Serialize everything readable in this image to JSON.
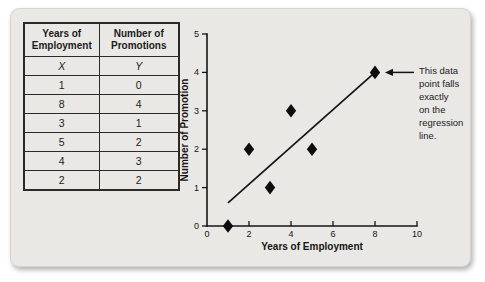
{
  "table": {
    "col1_header": "Years of\nEmployment",
    "col2_header": "Number of\nPromotions",
    "var_labels": [
      "X",
      "Y"
    ],
    "rows": [
      [
        "1",
        "0"
      ],
      [
        "8",
        "4"
      ],
      [
        "3",
        "1"
      ],
      [
        "5",
        "2"
      ],
      [
        "4",
        "3"
      ],
      [
        "2",
        "2"
      ]
    ]
  },
  "chart_data": {
    "type": "scatter",
    "title": "",
    "xlabel": "Years of Employment",
    "ylabel": "Number of Promotion",
    "xlim": [
      0,
      10
    ],
    "ylim": [
      0,
      5
    ],
    "xticks": [
      0,
      2,
      4,
      6,
      8,
      10
    ],
    "yticks": [
      0,
      1,
      2,
      3,
      4,
      5
    ],
    "grid": false,
    "legend": null,
    "marker": "diamond",
    "points": [
      {
        "x": 1,
        "y": 0
      },
      {
        "x": 8,
        "y": 4
      },
      {
        "x": 3,
        "y": 1
      },
      {
        "x": 5,
        "y": 2
      },
      {
        "x": 4,
        "y": 3
      },
      {
        "x": 2,
        "y": 2
      }
    ],
    "regression_line": {
      "x_start": 1,
      "y_start": 0.6,
      "x_end": 8,
      "y_end": 4
    },
    "annotation": {
      "lines": [
        "This data",
        "point falls",
        "exactly",
        "on the",
        "regression",
        "line."
      ],
      "arrow_points_at": {
        "x": 8,
        "y": 4
      }
    }
  },
  "colors": {
    "card_bg": "#e9e8e5",
    "ink": "#141414",
    "page_bg": "#ffffff"
  }
}
